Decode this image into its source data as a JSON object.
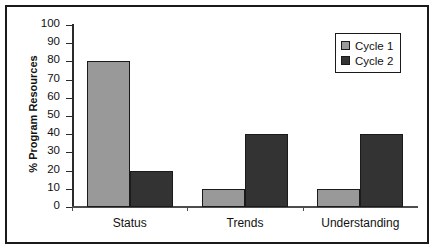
{
  "chart_data": {
    "type": "bar",
    "title": "",
    "xlabel": "",
    "ylabel": "% Program Resources",
    "ylim": [
      0,
      100
    ],
    "yticks": [
      0,
      10,
      20,
      30,
      40,
      50,
      60,
      70,
      80,
      90,
      100
    ],
    "grid": false,
    "legend_position": "top-right",
    "categories": [
      "Status",
      "Trends",
      "Understanding"
    ],
    "series": [
      {
        "name": "Cycle 1",
        "values": [
          80,
          10,
          10
        ],
        "color": "#999999"
      },
      {
        "name": "Cycle 2",
        "values": [
          20,
          40,
          40
        ],
        "color": "#333333"
      }
    ]
  }
}
